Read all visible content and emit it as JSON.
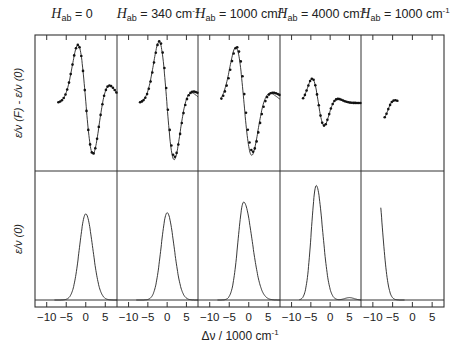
{
  "chart_data": {
    "type": "line",
    "layout": "2 rows x 5 columns small multiples, shared x-axis",
    "panel_titles": [
      {
        "symbol": "H",
        "subscript": "ab",
        "value": "= 0",
        "unit": ""
      },
      {
        "symbol": "H",
        "subscript": "ab",
        "value": "= 340 cm",
        "unit": "-1"
      },
      {
        "symbol": "H",
        "subscript": "ab",
        "value": "= 1000 cm",
        "unit": "-1"
      },
      {
        "symbol": "H",
        "subscript": "ab",
        "value": "= 4000 cm",
        "unit": "-1"
      },
      {
        "symbol": "H",
        "subscript": "ab",
        "value": "= 1000 cm",
        "unit": "-1"
      }
    ],
    "xlabel": "Δν / 1000 cm",
    "xlabel_unit": "-1",
    "xticks": [
      "−10",
      "−5",
      "0",
      "5"
    ],
    "xtick_values": [
      -10,
      -5,
      0,
      5
    ],
    "xlim": [
      -13,
      8
    ],
    "ylabel_top": "ε/ν (F) - ε/ν (0)",
    "ylabel_bottom": "ε/ν (0)",
    "grid": false,
    "legend": "none (solid line = calculated, dotted = derivative fit)",
    "top_row": [
      {
        "panel": 1,
        "center": 0.0,
        "width": 2.0,
        "amp1": 1.0,
        "amp2": 0.0,
        "dotted_match": true,
        "peak_pos_approx": -1.0,
        "trough_pos_approx": 0.8,
        "shoulder_pos_approx": 3.5
      },
      {
        "panel": 2,
        "center": 0.0,
        "width": 2.0,
        "amp1": 1.05,
        "amp2": 0.15,
        "dotted_match": false,
        "peak_pos_approx": -1.5,
        "trough_pos_approx": 0.5,
        "shoulder_pos_approx": 3.5
      },
      {
        "panel": 3,
        "center": -1.0,
        "width": 2.1,
        "amp1": 0.95,
        "amp2": 0.35,
        "dotted_match": false,
        "peak_pos_approx": -2.5,
        "trough_pos_approx": 0.0,
        "shoulder_pos_approx": 3.5
      },
      {
        "panel": 4,
        "center": -3.0,
        "width": 1.6,
        "amp1": 0.42,
        "amp2": 0.05,
        "dotted_match": true,
        "peak_pos_approx": -4.5,
        "trough_pos_approx": -2.3,
        "shoulder_pos_approx": 3.0
      },
      {
        "panel": 5,
        "center": -8.5,
        "width": 1.3,
        "amp1": 0.28,
        "amp2": 0.0,
        "dotted_match": true,
        "peak_pos_approx": -9.7,
        "trough_pos_approx": -7.5,
        "shoulder_pos_approx": -3.5
      }
    ],
    "bottom_row": [
      {
        "panel": 1,
        "peak_x": 0.0,
        "height": 0.73,
        "fwhm": 3.8,
        "skew": 0.1,
        "side_band": 0
      },
      {
        "panel": 2,
        "peak_x": 0.0,
        "height": 0.74,
        "fwhm": 3.7,
        "skew": 0.15,
        "side_band": 0
      },
      {
        "panel": 3,
        "peak_x": -1.3,
        "height": 0.83,
        "fwhm": 3.4,
        "skew": 0.5,
        "side_band": 0
      },
      {
        "panel": 4,
        "peak_x": -3.6,
        "height": 0.97,
        "fwhm": 3.0,
        "skew": 0.3,
        "side_band": 0.02
      },
      {
        "panel": 5,
        "peak_x": -9.0,
        "height": 1.0,
        "fwhm": 2.8,
        "skew": 0.2,
        "side_band": 0
      }
    ]
  }
}
